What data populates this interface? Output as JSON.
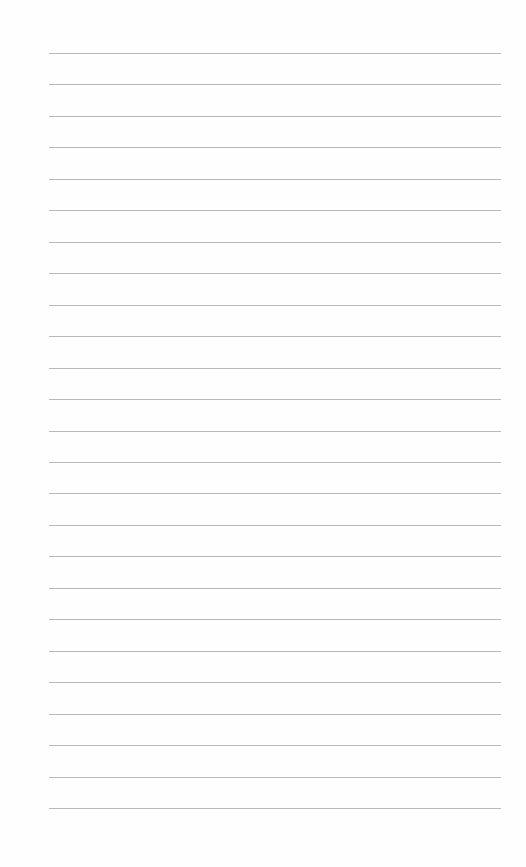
{
  "page": {
    "type": "lined-paper",
    "background_color": "#fefefe",
    "rule_color": "#b9b9b9",
    "rule_count": 25,
    "rule_left_px": 49,
    "rule_right_px": 501,
    "first_rule_y_px": 53,
    "last_rule_y_px": 808,
    "content": []
  }
}
